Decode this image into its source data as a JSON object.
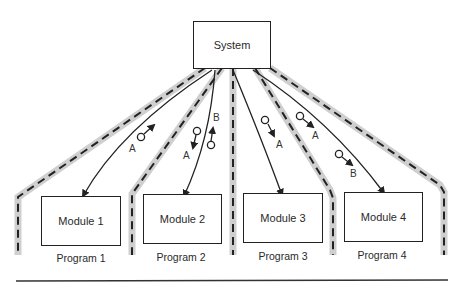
{
  "system": {
    "label": "System"
  },
  "modules": [
    {
      "label": "Module 1",
      "program": "Program 1"
    },
    {
      "label": "Module 2",
      "program": "Program 2"
    },
    {
      "label": "Module 3",
      "program": "Program 3"
    },
    {
      "label": "Module 4",
      "program": "Program 4"
    }
  ],
  "data_flows": [
    {
      "label": "A",
      "direction": "up",
      "between": "Module 1 - System"
    },
    {
      "label": "A",
      "direction": "down",
      "between": "System - Module 2"
    },
    {
      "label": "B",
      "direction": "up",
      "between": "Module 2 - System"
    },
    {
      "label": "A",
      "direction": "down",
      "between": "System - Module 3"
    },
    {
      "label": "A",
      "direction": "down",
      "between": "System - Module 4"
    },
    {
      "label": "B",
      "direction": "down",
      "between": "System - Module 4"
    }
  ],
  "colors": {
    "line": "#222222",
    "boundary_shadow": "#cccccc"
  }
}
